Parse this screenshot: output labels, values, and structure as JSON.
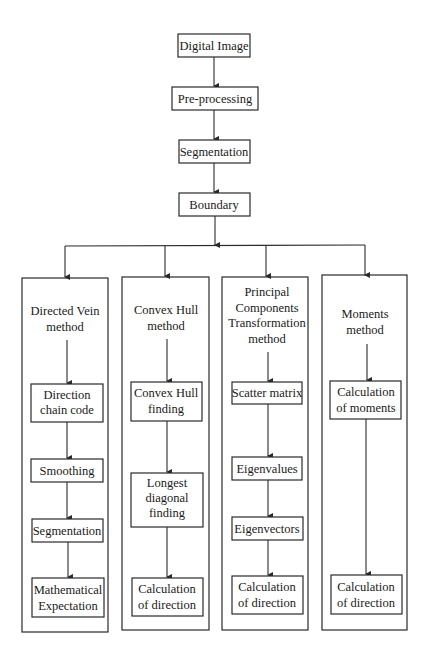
{
  "diagram": {
    "type": "flowchart",
    "top_chain": [
      {
        "id": "digital_image",
        "label": "Digital Image"
      },
      {
        "id": "pre_processing",
        "label": "Pre-processing"
      },
      {
        "id": "segmentation",
        "label": "Segmentation"
      },
      {
        "id": "boundary",
        "label": "Boundary"
      }
    ],
    "methods": [
      {
        "title": [
          "Directed Vein",
          "method"
        ],
        "steps": [
          [
            "Direction",
            "chain code"
          ],
          [
            "Smoothing"
          ],
          [
            "Segmentation"
          ],
          [
            "Mathematical",
            "Expectation"
          ]
        ]
      },
      {
        "title": [
          "Convex Hull",
          "method"
        ],
        "steps": [
          [
            "Convex Hull",
            "finding"
          ],
          [
            "Longest",
            "diagonal",
            "finding"
          ],
          [
            "Calculation",
            "of direction"
          ]
        ]
      },
      {
        "title": [
          "Principal",
          "Components",
          "Transformation",
          "method"
        ],
        "steps": [
          [
            "Scatter matrix"
          ],
          [
            "Eigenvalues"
          ],
          [
            "Eigenvectors"
          ],
          [
            "Calculation",
            "of direction"
          ]
        ]
      },
      {
        "title": [
          "Moments",
          "method"
        ],
        "steps": [
          [
            "Calculation",
            "of moments"
          ],
          [
            "Calculation",
            "of direction"
          ]
        ]
      }
    ],
    "edges": [
      [
        "Digital Image",
        "Pre-processing"
      ],
      [
        "Pre-processing",
        "Segmentation"
      ],
      [
        "Segmentation",
        "Boundary"
      ],
      [
        "Boundary",
        "Directed Vein method"
      ],
      [
        "Boundary",
        "Convex Hull method"
      ],
      [
        "Boundary",
        "Principal Components Transformation method"
      ],
      [
        "Boundary",
        "Moments method"
      ]
    ]
  }
}
